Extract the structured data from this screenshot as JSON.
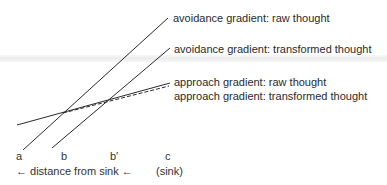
{
  "diagram": {
    "type": "approach-avoidance gradients",
    "lines": [
      {
        "id": "avoidance_raw",
        "label": "avoidance gradient: raw thought",
        "style": "solid"
      },
      {
        "id": "avoidance_transformed",
        "label": "avoidance gradient: transformed thought",
        "style": "solid"
      },
      {
        "id": "approach_raw",
        "label": "approach gradient: raw thought",
        "style": "solid"
      },
      {
        "id": "approach_transformed",
        "label": "approach gradient: transformed thought",
        "style": "dashed"
      }
    ],
    "points": [
      "a",
      "b",
      "b′",
      "c"
    ],
    "axis_label": "← distance from sink ←",
    "sink_label": "(sink)"
  },
  "colors": {
    "line": "#2a2a2a",
    "background": "#ffffff"
  }
}
